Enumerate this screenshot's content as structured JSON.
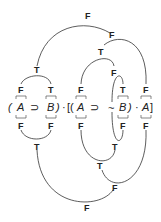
{
  "diagram": {
    "formula": {
      "open_paren": "(",
      "a1": "A",
      "implies1": "⊃",
      "b1": "B",
      "close_paren1": ")",
      "dot1": "·",
      "open_brackets": "[(",
      "a2": "A",
      "implies2": "⊃",
      "neg": "~",
      "b2": "B",
      "close_paren2": ")",
      "dot2": "·",
      "a3": "A",
      "close_bracket": "]"
    },
    "top_values": {
      "a1": "F",
      "b1": "T",
      "a2": "F",
      "b2": "T",
      "a3": "F",
      "impl1": "T",
      "neg_b": "F",
      "impl2": "T",
      "conj_inner": "F",
      "main": "F"
    },
    "bottom_values": {
      "a1": "F",
      "b1": "F",
      "a2": "F",
      "b2": "F",
      "a3": "F",
      "impl1": "T",
      "neg_b": "T",
      "impl2": "T",
      "conj_inner": "F",
      "main": "F"
    }
  }
}
